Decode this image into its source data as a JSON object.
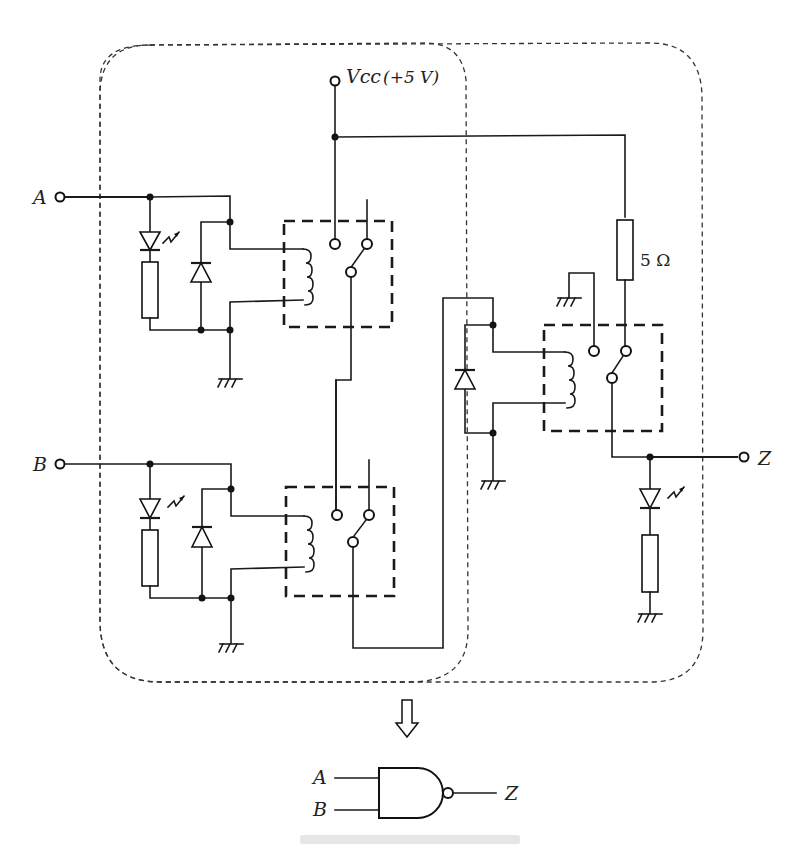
{
  "diagram": {
    "type": "relay-logic-schematic",
    "labels": {
      "input_a": "A",
      "input_b": "B",
      "output_z": "Z",
      "vcc": "Vcc",
      "vcc_value": "(+5 V)",
      "resistor_value": "5 Ω"
    },
    "components": {
      "relays": [
        {
          "id": "relay-a",
          "driven_by": "A",
          "contacts": "NO",
          "note": "coil with flyback diode, input indicator LED + resistor"
        },
        {
          "id": "relay-b",
          "driven_by": "B",
          "contacts": "NO",
          "note": "series with relay-a contacts"
        },
        {
          "id": "relay-out",
          "driven_by": "A·B series path",
          "contacts": "NC to output, pulls Z low when energized"
        }
      ],
      "leds": [
        "A indicator",
        "B indicator",
        "Z indicator"
      ],
      "pull_up_resistor": "5 Ω"
    },
    "equivalent_gate": {
      "symbol": "NAND",
      "inputs": [
        "A",
        "B"
      ],
      "output": "Z"
    },
    "arrow": "down-arrow",
    "caption_visible": false
  }
}
